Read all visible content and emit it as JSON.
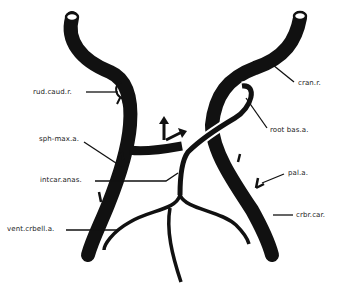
{
  "diagram": {
    "type": "anatomical-vessel-diagram",
    "colors": {
      "vessel": "#111111",
      "background": "#ffffff",
      "text": "#222222"
    },
    "labels": {
      "rud_caud_r": "rud.caud.r.",
      "sph_max_a": "sph-max.a.",
      "intcar_anas": "intcar.anas.",
      "vent_crbell_a": "vent.crbell.a.",
      "cran_r": "cran.r.",
      "root_bas_a": "root bas.a.",
      "pal_a": "pal.a.",
      "crbr_car": "crbr.car."
    },
    "annotations": {
      "flow_arrows": "arrows indicating flow direction (up and right)"
    }
  }
}
